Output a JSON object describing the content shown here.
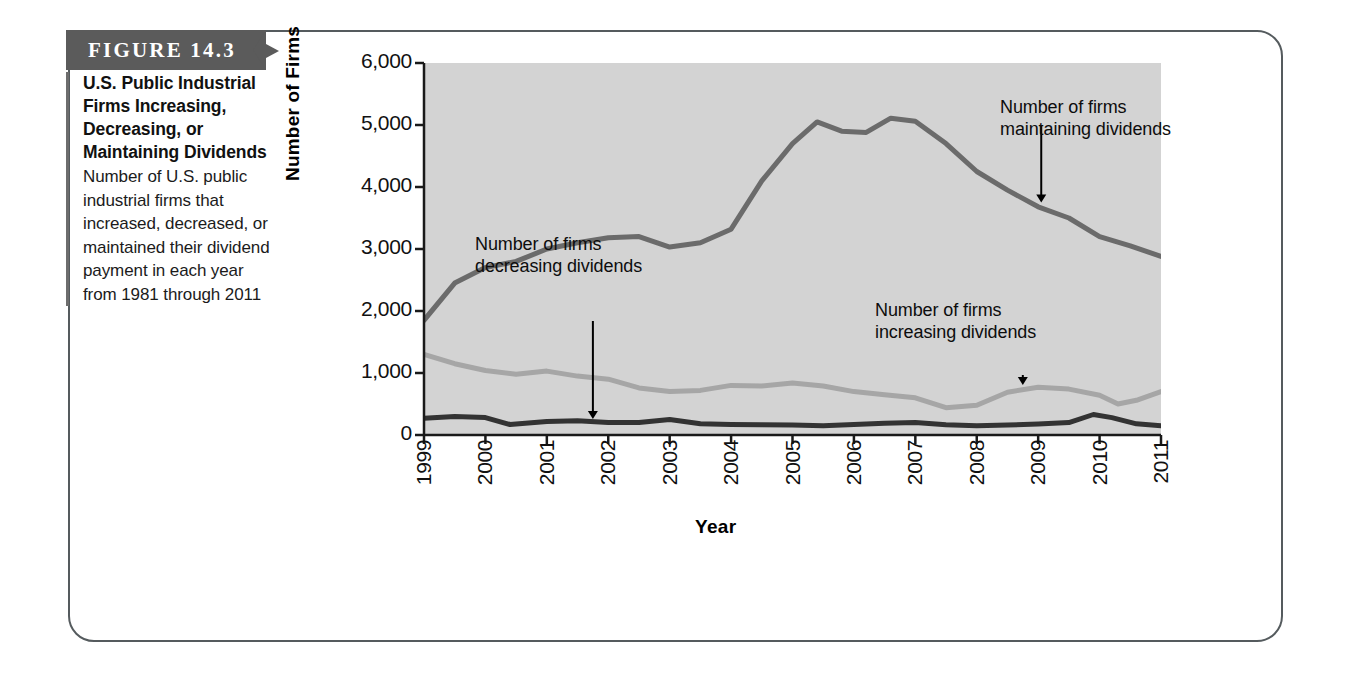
{
  "figure": {
    "banner_label": "FIGURE 14.3",
    "caption_title": "U.S. Public Industrial Firms Increasing, Decreasing, or Maintaining Dividends",
    "caption_body": "Number of U.S. public industrial firms that increased, decreased, or maintained their dividend payment in each year from 1981 through 2011"
  },
  "colors": {
    "banner_bg": "#5b5b5b",
    "card_border": "#555b5e",
    "plot_bg": "#d3d3d3",
    "maintaining_line": "#6b6b6b",
    "increasing_line": "#a6a6a6",
    "decreasing_line": "#333333",
    "axis": "#1a1a1a"
  },
  "chart_data": {
    "type": "line",
    "title": "U.S. Public Industrial Firms Increasing, Decreasing, or Maintaining Dividends",
    "xlabel": "Year",
    "ylabel": "Number of Firms",
    "xlim": [
      1999,
      2011
    ],
    "ylim": [
      0,
      6000
    ],
    "yticks": [
      0,
      1000,
      2000,
      3000,
      4000,
      5000,
      6000
    ],
    "ytick_labels": [
      "0",
      "1,000",
      "2,000",
      "3,000",
      "4,000",
      "5,000",
      "6,000"
    ],
    "x": [
      1999,
      2000,
      2001,
      2002,
      2003,
      2004,
      2005,
      2006,
      2007,
      2008,
      2009,
      2010,
      2011
    ],
    "xtick_labels": [
      "1999",
      "2000",
      "2001",
      "2002",
      "2003",
      "2004",
      "2005",
      "2006",
      "2007",
      "2008",
      "2009",
      "2010",
      "2011"
    ],
    "grid": false,
    "legend": "annotations",
    "series": [
      {
        "name": "Number of firms maintaining dividends",
        "color": "#6b6b6b",
        "values": [
          1850,
          2700,
          3000,
          3150,
          3050,
          3550,
          5000,
          4900,
          5100,
          4600,
          3750,
          3200,
          2880
        ],
        "points": [
          {
            "x": 1999.0,
            "y": 1850
          },
          {
            "x": 1999.5,
            "y": 2450
          },
          {
            "x": 2000.0,
            "y": 2700
          },
          {
            "x": 2000.5,
            "y": 2800
          },
          {
            "x": 2001.0,
            "y": 3000
          },
          {
            "x": 2001.5,
            "y": 3100
          },
          {
            "x": 2002.0,
            "y": 3180
          },
          {
            "x": 2002.5,
            "y": 3200
          },
          {
            "x": 2003.0,
            "y": 3030
          },
          {
            "x": 2003.5,
            "y": 3100
          },
          {
            "x": 2004.0,
            "y": 3320
          },
          {
            "x": 2004.5,
            "y": 4100
          },
          {
            "x": 2005.0,
            "y": 4700
          },
          {
            "x": 2005.4,
            "y": 5050
          },
          {
            "x": 2005.8,
            "y": 4900
          },
          {
            "x": 2006.2,
            "y": 4880
          },
          {
            "x": 2006.6,
            "y": 5110
          },
          {
            "x": 2007.0,
            "y": 5060
          },
          {
            "x": 2007.5,
            "y": 4700
          },
          {
            "x": 2008.0,
            "y": 4250
          },
          {
            "x": 2008.5,
            "y": 3950
          },
          {
            "x": 2009.0,
            "y": 3680
          },
          {
            "x": 2009.5,
            "y": 3500
          },
          {
            "x": 2010.0,
            "y": 3200
          },
          {
            "x": 2010.5,
            "y": 3050
          },
          {
            "x": 2011.0,
            "y": 2880
          }
        ]
      },
      {
        "name": "Number of firms increasing dividends",
        "color": "#a6a6a6",
        "values": [
          1300,
          1050,
          950,
          900,
          700,
          800,
          750,
          650,
          500,
          600,
          780,
          570,
          700
        ],
        "points": [
          {
            "x": 1999.0,
            "y": 1300
          },
          {
            "x": 1999.5,
            "y": 1150
          },
          {
            "x": 2000.0,
            "y": 1040
          },
          {
            "x": 2000.5,
            "y": 980
          },
          {
            "x": 2001.0,
            "y": 1030
          },
          {
            "x": 2001.5,
            "y": 950
          },
          {
            "x": 2002.0,
            "y": 900
          },
          {
            "x": 2002.5,
            "y": 760
          },
          {
            "x": 2003.0,
            "y": 700
          },
          {
            "x": 2003.5,
            "y": 720
          },
          {
            "x": 2004.0,
            "y": 800
          },
          {
            "x": 2004.5,
            "y": 790
          },
          {
            "x": 2005.0,
            "y": 840
          },
          {
            "x": 2005.5,
            "y": 790
          },
          {
            "x": 2006.0,
            "y": 700
          },
          {
            "x": 2006.5,
            "y": 650
          },
          {
            "x": 2007.0,
            "y": 600
          },
          {
            "x": 2007.5,
            "y": 440
          },
          {
            "x": 2008.0,
            "y": 480
          },
          {
            "x": 2008.5,
            "y": 690
          },
          {
            "x": 2009.0,
            "y": 770
          },
          {
            "x": 2009.5,
            "y": 740
          },
          {
            "x": 2010.0,
            "y": 640
          },
          {
            "x": 2010.3,
            "y": 500
          },
          {
            "x": 2010.6,
            "y": 560
          },
          {
            "x": 2011.0,
            "y": 700
          }
        ]
      },
      {
        "name": "Number of firms decreasing dividends",
        "color": "#333333",
        "values": [
          270,
          290,
          220,
          230,
          250,
          180,
          160,
          150,
          200,
          160,
          150,
          300,
          150
        ],
        "points": [
          {
            "x": 1999.0,
            "y": 270
          },
          {
            "x": 1999.5,
            "y": 300
          },
          {
            "x": 2000.0,
            "y": 280
          },
          {
            "x": 2000.4,
            "y": 170
          },
          {
            "x": 2001.0,
            "y": 220
          },
          {
            "x": 2001.5,
            "y": 230
          },
          {
            "x": 2002.0,
            "y": 200
          },
          {
            "x": 2002.5,
            "y": 200
          },
          {
            "x": 2003.0,
            "y": 250
          },
          {
            "x": 2003.5,
            "y": 180
          },
          {
            "x": 2004.0,
            "y": 170
          },
          {
            "x": 2004.5,
            "y": 165
          },
          {
            "x": 2005.0,
            "y": 160
          },
          {
            "x": 2005.5,
            "y": 150
          },
          {
            "x": 2006.0,
            "y": 170
          },
          {
            "x": 2006.5,
            "y": 190
          },
          {
            "x": 2007.0,
            "y": 200
          },
          {
            "x": 2007.5,
            "y": 165
          },
          {
            "x": 2008.0,
            "y": 150
          },
          {
            "x": 2008.5,
            "y": 160
          },
          {
            "x": 2009.0,
            "y": 175
          },
          {
            "x": 2009.5,
            "y": 200
          },
          {
            "x": 2009.9,
            "y": 330
          },
          {
            "x": 2010.2,
            "y": 280
          },
          {
            "x": 2010.6,
            "y": 180
          },
          {
            "x": 2011.0,
            "y": 150
          }
        ]
      }
    ],
    "annotations": [
      {
        "id": "maintaining",
        "text_line1": "Number of firms",
        "text_line2": "maintaining dividends",
        "target_x": 2009.05,
        "target_y": 3700
      },
      {
        "id": "decreasing",
        "text_line1": "Number of firms",
        "text_line2": "decreasing dividends",
        "target_x": 2001.75,
        "target_y": 210
      },
      {
        "id": "increasing",
        "text_line1": "Number of firms",
        "text_line2": "increasing dividends",
        "target_x": 2008.75,
        "target_y": 760
      }
    ]
  }
}
